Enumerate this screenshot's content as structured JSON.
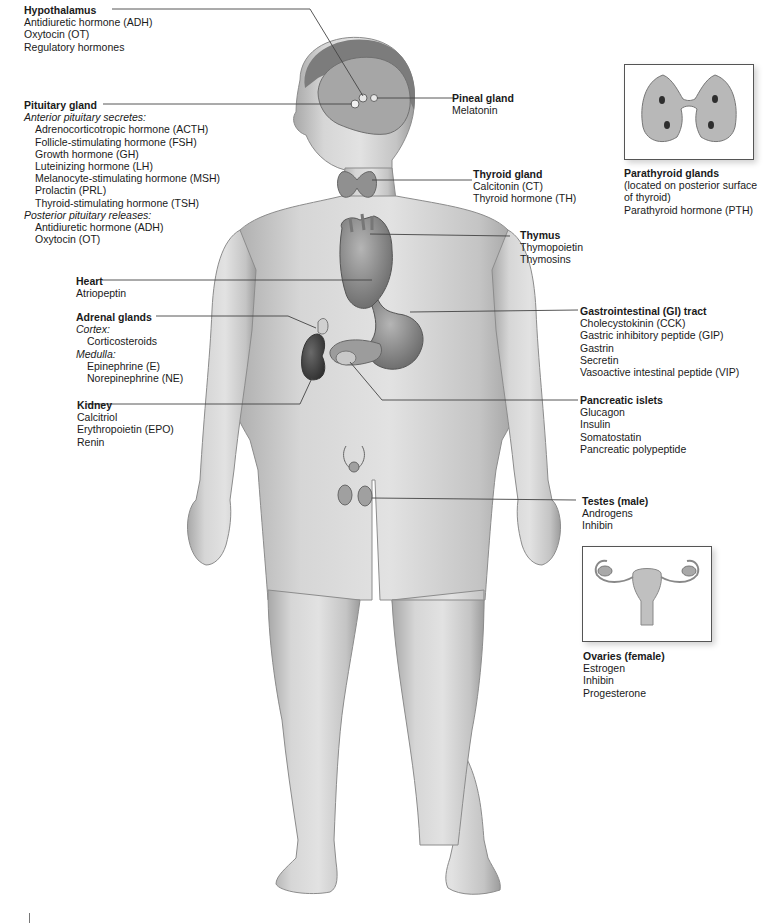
{
  "diagram": {
    "glands": [
      {
        "id": "hypothalamus",
        "title": "Hypothalamus",
        "items": [
          "Antidiuretic hormone (ADH)",
          "Oxytocin (OT)",
          "Regulatory hormones"
        ]
      },
      {
        "id": "pituitary",
        "title": "Pituitary gland",
        "anterior_heading": "Anterior pituitary secretes:",
        "anterior": [
          "Adrenocorticotropic hormone (ACTH)",
          "Follicle-stimulating hormone (FSH)",
          "Growth hormone (GH)",
          "Luteinizing hormone (LH)",
          "Melanocyte-stimulating hormone (MSH)",
          "Prolactin (PRL)",
          "Thyroid-stimulating hormone (TSH)"
        ],
        "posterior_heading": "Posterior pituitary releases:",
        "posterior": [
          "Antidiuretic hormone (ADH)",
          "Oxytocin (OT)"
        ]
      },
      {
        "id": "heart",
        "title": "Heart",
        "items": [
          "Atriopeptin"
        ]
      },
      {
        "id": "adrenal",
        "title": "Adrenal glands",
        "cortex_heading": "Cortex:",
        "cortex": [
          "Corticosteroids"
        ],
        "medulla_heading": "Medulla:",
        "medulla": [
          "Epinephrine (E)",
          "Norepinephrine (NE)"
        ]
      },
      {
        "id": "kidney",
        "title": "Kidney",
        "items": [
          "Calcitriol",
          "Erythropoietin (EPO)",
          "Renin"
        ]
      },
      {
        "id": "pineal",
        "title": "Pineal gland",
        "items": [
          "Melatonin"
        ]
      },
      {
        "id": "thyroid",
        "title": "Thyroid gland",
        "items": [
          "Calcitonin (CT)",
          "Thyroid hormone (TH)"
        ]
      },
      {
        "id": "thymus",
        "title": "Thymus",
        "items": [
          "Thymopoietin",
          "Thymosins"
        ]
      },
      {
        "id": "parathyroid",
        "title": "Parathyroid glands",
        "items": [
          "(located on posterior surface",
          "of thyroid)",
          "Parathyroid hormone (PTH)"
        ]
      },
      {
        "id": "gi",
        "title": "Gastrointestinal (GI) tract",
        "items": [
          "Cholecystokinin (CCK)",
          "Gastric inhibitory peptide (GIP)",
          "Gastrin",
          "Secretin",
          "Vasoactive intestinal peptide (VIP)"
        ]
      },
      {
        "id": "pancreas",
        "title": "Pancreatic islets",
        "items": [
          "Glucagon",
          "Insulin",
          "Somatostatin",
          "Pancreatic polypeptide"
        ]
      },
      {
        "id": "testes",
        "title": "Testes (male)",
        "items": [
          "Androgens",
          "Inhibin"
        ]
      },
      {
        "id": "ovaries",
        "title": "Ovaries (female)",
        "items": [
          "Estrogen",
          "Inhibin",
          "Progesterone"
        ]
      }
    ],
    "colors": {
      "skin": "#cfcfcf",
      "skin_shadow": "#9a9a9a",
      "organ": "#8a8a8a",
      "kidney": "#4a4a4a",
      "leader": "#444444",
      "text": "#1a1a1a"
    }
  }
}
